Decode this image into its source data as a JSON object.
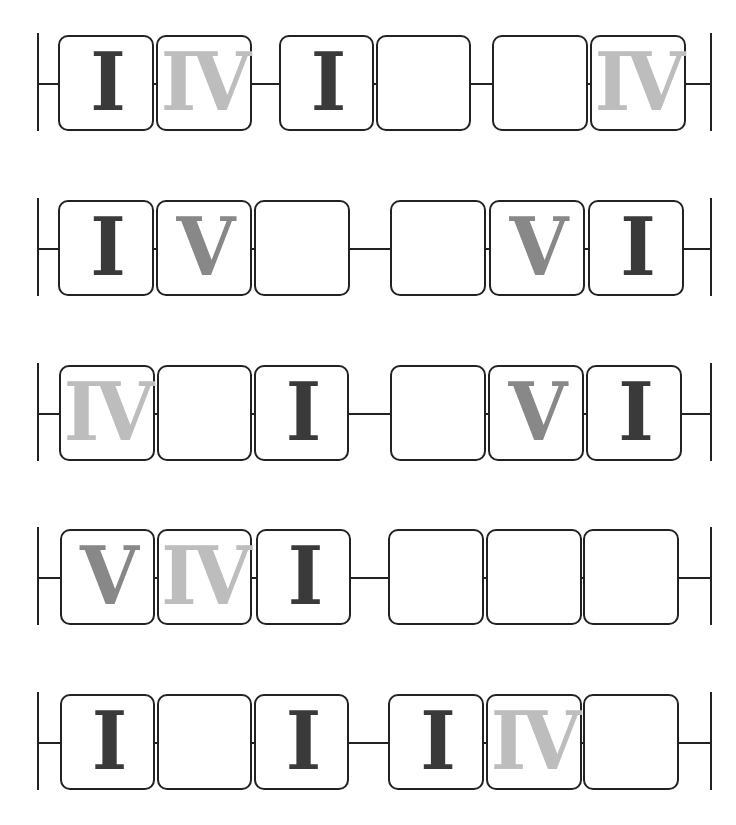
{
  "colors": {
    "I": "#3a3a3a",
    "V": "#888888",
    "IV": "#bdbdbd",
    "line": "#222222"
  },
  "rows": [
    {
      "top": 35,
      "left_bar": 37,
      "right_bar": 710,
      "boxes": [
        {
          "x": 58,
          "w": 96,
          "label": "I"
        },
        {
          "x": 156,
          "w": 96,
          "label": "IV"
        },
        {
          "x": 279,
          "w": 95,
          "label": "I"
        },
        {
          "x": 376,
          "w": 95,
          "label": ""
        },
        {
          "x": 492,
          "w": 96,
          "label": ""
        },
        {
          "x": 590,
          "w": 96,
          "label": "IV"
        }
      ]
    },
    {
      "top": 200,
      "left_bar": 37,
      "right_bar": 710,
      "boxes": [
        {
          "x": 58,
          "w": 96,
          "label": "I"
        },
        {
          "x": 156,
          "w": 96,
          "label": "V"
        },
        {
          "x": 254,
          "w": 96,
          "label": ""
        },
        {
          "x": 390,
          "w": 96,
          "label": ""
        },
        {
          "x": 489,
          "w": 96,
          "label": "V"
        },
        {
          "x": 588,
          "w": 96,
          "label": "I"
        }
      ]
    },
    {
      "top": 365,
      "left_bar": 37,
      "right_bar": 710,
      "boxes": [
        {
          "x": 59,
          "w": 96,
          "label": "IV"
        },
        {
          "x": 157,
          "w": 95,
          "label": ""
        },
        {
          "x": 254,
          "w": 95,
          "label": "I"
        },
        {
          "x": 390,
          "w": 96,
          "label": ""
        },
        {
          "x": 488,
          "w": 96,
          "label": "V"
        },
        {
          "x": 586,
          "w": 96,
          "label": "I"
        }
      ]
    },
    {
      "top": 529,
      "left_bar": 37,
      "right_bar": 710,
      "boxes": [
        {
          "x": 60,
          "w": 95,
          "label": "V"
        },
        {
          "x": 157,
          "w": 95,
          "label": "IV"
        },
        {
          "x": 256,
          "w": 95,
          "label": "I"
        },
        {
          "x": 388,
          "w": 96,
          "label": ""
        },
        {
          "x": 486,
          "w": 96,
          "label": ""
        },
        {
          "x": 583,
          "w": 96,
          "label": ""
        }
      ]
    },
    {
      "top": 694,
      "left_bar": 37,
      "right_bar": 710,
      "boxes": [
        {
          "x": 60,
          "w": 95,
          "label": "I"
        },
        {
          "x": 157,
          "w": 95,
          "label": ""
        },
        {
          "x": 254,
          "w": 95,
          "label": "I"
        },
        {
          "x": 388,
          "w": 96,
          "label": "I"
        },
        {
          "x": 486,
          "w": 96,
          "label": "IV"
        },
        {
          "x": 583,
          "w": 96,
          "label": ""
        }
      ]
    }
  ]
}
